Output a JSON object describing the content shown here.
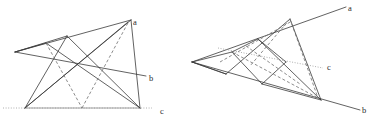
{
  "figure": {
    "background_color": "#ffffff",
    "width": 379,
    "height": 123,
    "stroke_color": "#3a3a3a",
    "dashed_color": "#6e6e6e",
    "dotted_color": "#9a9a9a"
  },
  "left_figure": {
    "name": "left-construction",
    "labels": {
      "a": "a",
      "b": "b",
      "c": "c"
    },
    "label_positions": {
      "a": {
        "x": 133,
        "y": 25
      },
      "b": {
        "x": 149,
        "y": 81
      },
      "c": {
        "x": 160,
        "y": 114
      }
    },
    "points": {
      "a_end": {
        "x": 128,
        "y": 19
      },
      "b_end": {
        "x": 144,
        "y": 76
      },
      "left_apex": {
        "x": 15,
        "y": 52
      },
      "top_mid": {
        "x": 67,
        "y": 36
      },
      "bot_left": {
        "x": 25,
        "y": 108
      },
      "bot_mid": {
        "x": 82,
        "y": 108
      },
      "bot_right": {
        "x": 140,
        "y": 108
      },
      "upper_left": {
        "x": 46,
        "y": 43
      },
      "cross_a": {
        "x": 55,
        "y": 58
      },
      "cross_b": {
        "x": 77,
        "y": 67
      },
      "cross_c": {
        "x": 97,
        "y": 72
      },
      "line_c_left": {
        "x": 3,
        "y": 108
      },
      "line_c_right": {
        "x": 152,
        "y": 108
      }
    },
    "solid_segments": [
      {
        "from": "left_apex",
        "to": "a_end"
      },
      {
        "from": "left_apex",
        "to": "b_end"
      },
      {
        "from": "left_apex",
        "to": "top_mid"
      },
      {
        "from": "top_mid",
        "to": "bot_left"
      },
      {
        "from": "top_mid",
        "to": "bot_right"
      },
      {
        "from": "a_end",
        "to": "bot_left"
      },
      {
        "from": "a_end",
        "to": "bot_mid_left_cross"
      },
      {
        "from": "upper_left",
        "to": "bot_right"
      },
      {
        "from": "bot_left",
        "to": "a_end_low"
      }
    ],
    "dashed_segments": [
      {
        "from": "upper_left",
        "to": "bot_mid"
      },
      {
        "from": "bot_mid",
        "to": "a_end"
      }
    ],
    "dotted_line": {
      "name": "line-c",
      "from": "line_c_left",
      "to": "line_c_right"
    }
  },
  "right_figure": {
    "name": "right-construction",
    "labels": {
      "a": "a",
      "b": "b",
      "c": "c"
    },
    "label_positions": {
      "a": {
        "x": 348,
        "y": 11
      },
      "b": {
        "x": 362,
        "y": 113
      },
      "c": {
        "x": 327,
        "y": 70
      }
    },
    "points": {
      "a_end": {
        "x": 343,
        "y": 6
      },
      "b_end": {
        "x": 357,
        "y": 108
      },
      "left_apex": {
        "x": 192,
        "y": 62
      },
      "upper_node": {
        "x": 258,
        "y": 39
      },
      "hinge_top": {
        "x": 290,
        "y": 19
      },
      "conv_right": {
        "x": 321,
        "y": 100
      },
      "mid_node": {
        "x": 236,
        "y": 55
      },
      "low_node": {
        "x": 262,
        "y": 84
      },
      "line_c_in": {
        "x": 232,
        "y": 52
      },
      "line_c_out": {
        "x": 322,
        "y": 68
      }
    },
    "dotted_line": {
      "name": "line-c",
      "from": "line_c_in",
      "to": "line_c_out"
    }
  }
}
